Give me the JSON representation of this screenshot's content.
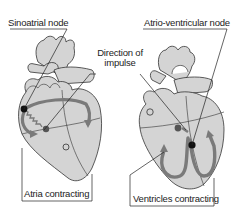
{
  "labels": {
    "sinoatrial_node": "Sinoatrial node",
    "atrio_ventricular_node": "Atrio-ventricular node",
    "direction_of_impulse_line1": "Direction of",
    "direction_of_impulse_line2": "impulse",
    "atria_contracting": "Atria contracting",
    "ventricles_contracting": "Ventricles contracting"
  },
  "colors": {
    "heart_fill": "#d4d4d4",
    "outline": "#333333",
    "arrow": "#7a7a7a",
    "node_dark": "#111111",
    "node_grey": "#555555"
  }
}
